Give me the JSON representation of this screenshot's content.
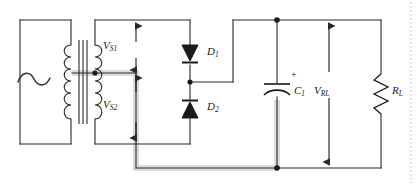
{
  "figure": {
    "background_color": "#ffffff",
    "wire_color": "#2a2a2a",
    "highlight_color": "#d9d9d9"
  },
  "labels": {
    "vs1": "V",
    "vs1_sub": "S1",
    "vs2": "V",
    "vs2_sub": "S2",
    "d1": "D",
    "d1_sub": "1",
    "d2": "D",
    "d2_sub": "2",
    "c1": "C",
    "c1_sub": "1",
    "vrl": "V",
    "vrl_sub": "RL",
    "rl": "R",
    "rl_sub": "L",
    "cap_polarity": "+"
  },
  "components": [
    {
      "name": "ac-source",
      "symbol": "~",
      "label": ""
    },
    {
      "name": "transformer",
      "symbol": "center-tapped-transformer",
      "label": ""
    },
    {
      "name": "diode-d1",
      "symbol": "diode",
      "orientation": "down",
      "label": "D1"
    },
    {
      "name": "diode-d2",
      "symbol": "diode",
      "orientation": "up",
      "label": "D2"
    },
    {
      "name": "capacitor-c1",
      "symbol": "polarized-capacitor",
      "label": "C1",
      "polarity": "+"
    },
    {
      "name": "resistor-rl",
      "symbol": "resistor",
      "label": "RL"
    }
  ],
  "measurements": [
    {
      "name": "vs1-arrow",
      "label": "VS1",
      "direction": "vertical-double"
    },
    {
      "name": "vs2-arrow",
      "label": "VS2",
      "direction": "vertical-double"
    },
    {
      "name": "vrl-arrow",
      "label": "VRL",
      "direction": "vertical-double"
    }
  ]
}
